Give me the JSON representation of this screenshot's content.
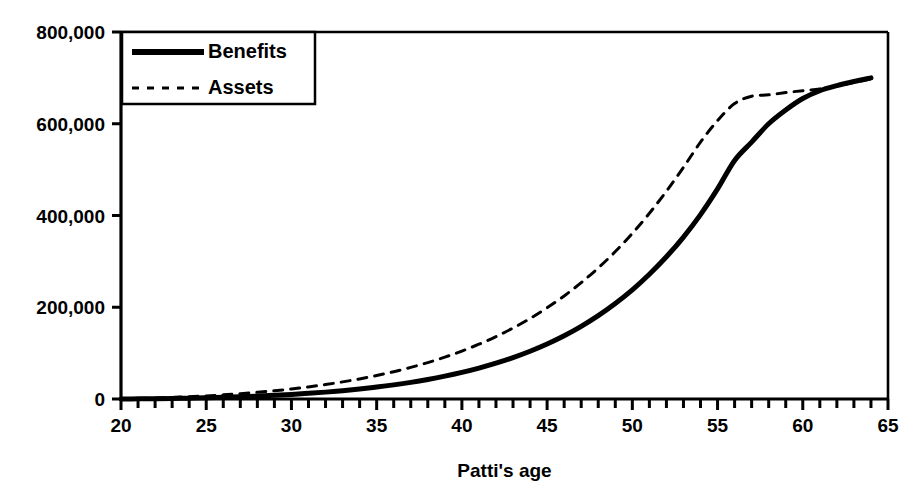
{
  "chart_data": {
    "type": "line",
    "title": "",
    "xlabel": "Patti's age",
    "ylabel": "",
    "xlim": [
      20,
      65
    ],
    "ylim": [
      0,
      800000
    ],
    "grid": false,
    "legend_position": "top-left",
    "x_ticks_major": [
      20,
      25,
      30,
      35,
      40,
      45,
      50,
      55,
      60,
      65
    ],
    "x_tick_labels": [
      "20",
      "25",
      "30",
      "35",
      "40",
      "45",
      "50",
      "55",
      "60",
      "65"
    ],
    "x_tick_interval_minor": 1,
    "y_ticks": [
      0,
      200000,
      400000,
      600000,
      800000
    ],
    "y_tick_labels": [
      "0",
      "200,000",
      "400,000",
      "600,000",
      "800,000"
    ],
    "x": [
      20,
      21,
      22,
      23,
      24,
      25,
      26,
      27,
      28,
      29,
      30,
      31,
      32,
      33,
      34,
      35,
      36,
      37,
      38,
      39,
      40,
      41,
      42,
      43,
      44,
      45,
      46,
      47,
      48,
      49,
      50,
      51,
      52,
      53,
      54,
      55,
      56,
      57,
      58,
      59,
      60,
      61,
      62,
      63,
      64
    ],
    "series": [
      {
        "name": "Benefits",
        "style": "solid",
        "color": "#000000",
        "width": 5,
        "values": [
          0,
          300,
          700,
          1200,
          1900,
          2700,
          3700,
          4900,
          6300,
          8000,
          10000,
          12300,
          15000,
          18200,
          21800,
          26000,
          30800,
          36300,
          42600,
          49800,
          58000,
          67400,
          78100,
          90300,
          104200,
          120000,
          138000,
          158500,
          181800,
          208300,
          238000,
          272000,
          310000,
          353000,
          402000,
          458000,
          520000,
          560000,
          600000,
          630000,
          655000,
          672000,
          683000,
          692000,
          700000
        ]
      },
      {
        "name": "Assets",
        "style": "dashed",
        "color": "#000000",
        "width": 3,
        "values": [
          0,
          900,
          2000,
          3300,
          4900,
          6800,
          9000,
          11600,
          14600,
          18000,
          21900,
          26400,
          31500,
          37300,
          43800,
          51200,
          59500,
          68900,
          79400,
          91200,
          104500,
          119400,
          136100,
          154700,
          175500,
          198800,
          224700,
          253600,
          285700,
          321400,
          361000,
          404800,
          453000,
          505000,
          560000,
          607000,
          644000,
          660000,
          663000,
          668000,
          672000,
          676000,
          682000,
          690000,
          698000
        ]
      }
    ],
    "legend": [
      {
        "label": "Benefits",
        "style": "solid"
      },
      {
        "label": "Assets",
        "style": "dashed"
      }
    ]
  }
}
